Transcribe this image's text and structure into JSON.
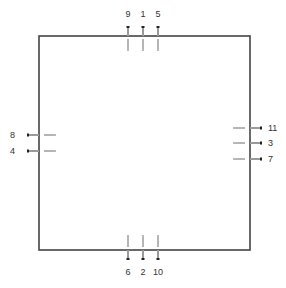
{
  "diagram": {
    "type": "pin-layout",
    "box": {
      "x": 39,
      "y": 36,
      "width": 211,
      "height": 214,
      "stroke": "#444444"
    },
    "pins": {
      "top": [
        {
          "label": "9",
          "pos": 128
        },
        {
          "label": "1",
          "pos": 143
        },
        {
          "label": "5",
          "pos": 158
        }
      ],
      "bottom": [
        {
          "label": "6",
          "pos": 128
        },
        {
          "label": "2",
          "pos": 143
        },
        {
          "label": "10",
          "pos": 158
        }
      ],
      "left": [
        {
          "label": "8",
          "pos": 135
        },
        {
          "label": "4",
          "pos": 151
        }
      ],
      "right": [
        {
          "label": "11",
          "pos": 128
        },
        {
          "label": "3",
          "pos": 143
        },
        {
          "label": "7",
          "pos": 159
        }
      ]
    }
  }
}
